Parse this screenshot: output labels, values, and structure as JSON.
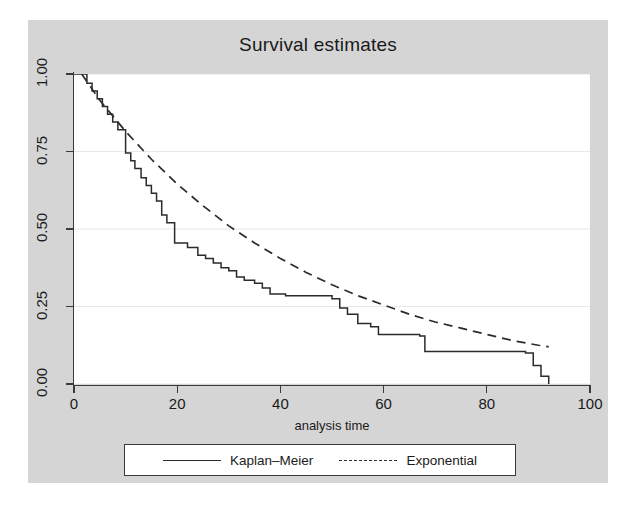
{
  "chart_data": {
    "type": "line",
    "title": "Survival estimates",
    "xlabel": "analysis time",
    "ylabel": "",
    "xlim": [
      0,
      100
    ],
    "ylim": [
      0.0,
      1.0
    ],
    "xticks": [
      0,
      20,
      40,
      60,
      80,
      100
    ],
    "xtick_labels": [
      "0",
      "20",
      "40",
      "60",
      "80",
      "100"
    ],
    "yticks": [
      0.0,
      0.25,
      0.5,
      0.75,
      1.0
    ],
    "ytick_labels": [
      "0.00",
      "0.25",
      "0.50",
      "0.75",
      "1.00"
    ],
    "grid": "horizontal",
    "legend_position": "below",
    "series": [
      {
        "name": "Kaplan-Meier",
        "style": "step-solid",
        "color": "#2b2b2b",
        "x": [
          0,
          1.5,
          2.5,
          3.5,
          4.5,
          5.5,
          6.5,
          7.5,
          8.5,
          10.0,
          11.0,
          11.8,
          13.0,
          14.0,
          15.0,
          16.0,
          17.0,
          18.0,
          19.5,
          22.0,
          24.0,
          25.5,
          27.0,
          28.5,
          30.0,
          31.5,
          33.0,
          35.0,
          36.5,
          38.0,
          41.0,
          50.0,
          51.5,
          53.0,
          55.0,
          57.5,
          59.0,
          67.0,
          68.0,
          87.5,
          89.0,
          90.5,
          92.0
        ],
        "y": [
          1.0,
          1.0,
          0.97,
          0.945,
          0.92,
          0.895,
          0.87,
          0.845,
          0.82,
          0.745,
          0.72,
          0.695,
          0.665,
          0.64,
          0.615,
          0.59,
          0.545,
          0.52,
          0.455,
          0.44,
          0.415,
          0.405,
          0.39,
          0.375,
          0.365,
          0.345,
          0.335,
          0.325,
          0.31,
          0.29,
          0.285,
          0.275,
          0.245,
          0.225,
          0.195,
          0.185,
          0.16,
          0.155,
          0.105,
          0.1,
          0.06,
          0.025,
          0.0
        ]
      },
      {
        "name": "Exponential",
        "style": "line-dashed",
        "color": "#2b2b2b",
        "x": [
          1.5,
          5,
          10,
          15,
          20,
          25,
          30,
          35,
          40,
          45,
          50,
          55,
          60,
          65,
          70,
          75,
          80,
          85,
          90,
          92
        ],
        "y": [
          1.0,
          0.915,
          0.815,
          0.725,
          0.645,
          0.575,
          0.51,
          0.455,
          0.405,
          0.36,
          0.32,
          0.285,
          0.255,
          0.225,
          0.2,
          0.18,
          0.16,
          0.14,
          0.125,
          0.12
        ]
      }
    ]
  },
  "legend": {
    "entries": [
      {
        "label": "Kaplan–Meier",
        "swatch": "solid-line-icon"
      },
      {
        "label": "Exponential",
        "swatch": "dashed-line-icon"
      }
    ]
  },
  "colors": {
    "graph_region_background": "#d5d5d5",
    "plot_background": "#ffffff",
    "axis": "#3a3a3a",
    "gridline": "#e8e8e8",
    "curve": "#2b2b2b",
    "text": "#1a1a1a"
  }
}
